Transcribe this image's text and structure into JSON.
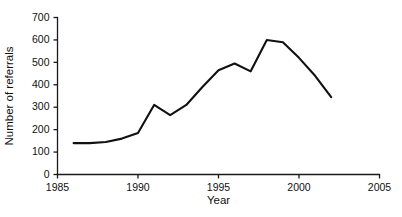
{
  "chart_data": {
    "type": "line",
    "title": "",
    "xlabel": "Year",
    "ylabel": "Number of referrals",
    "xlim": [
      1985,
      2005
    ],
    "ylim": [
      0,
      700
    ],
    "grid": false,
    "legend": "none",
    "xticks": [
      1985,
      1990,
      1995,
      2000,
      2005
    ],
    "xtick_labels": [
      "1985",
      "1990",
      "1995",
      "2000",
      "2005"
    ],
    "yticks": [
      0,
      100,
      200,
      300,
      400,
      500,
      600,
      700
    ],
    "ytick_labels": [
      "0",
      "100",
      "200",
      "300",
      "400",
      "500",
      "600",
      "700"
    ],
    "series": [
      {
        "name": "Number of referrals",
        "color": "#111111",
        "x": [
          1986,
          1987,
          1988,
          1989,
          1990,
          1991,
          1992,
          1993,
          1994,
          1995,
          1996,
          1997,
          1998,
          1999,
          2000,
          2001,
          2002
        ],
        "values": [
          140,
          140,
          145,
          160,
          185,
          310,
          265,
          310,
          390,
          465,
          495,
          460,
          600,
          590,
          520,
          440,
          345
        ]
      }
    ]
  },
  "axis_titles": {
    "x": "Year",
    "y": "Number of referrals"
  }
}
